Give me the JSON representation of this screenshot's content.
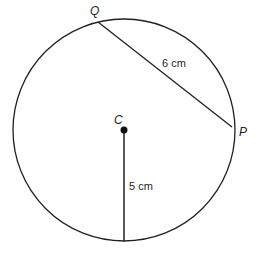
{
  "diagram": {
    "type": "circle-geometry",
    "stroke_color": "#231f20",
    "background": "#ffffff",
    "circle": {
      "center_label": "C",
      "center": [
        124,
        130
      ],
      "radius_px": 111
    },
    "points": [
      {
        "label": "Q",
        "position": [
          98,
          22
        ],
        "label_pos": [
          90,
          15
        ]
      },
      {
        "label": "P",
        "position": [
          232,
          127
        ],
        "label_pos": [
          239,
          136
        ]
      },
      {
        "label": "C",
        "position": [
          124,
          130
        ],
        "label_pos": [
          114,
          124
        ]
      }
    ],
    "segments": [
      {
        "from": "Q",
        "to": "P",
        "type": "chord",
        "length_label": "6 cm",
        "label_pos": [
          162,
          67
        ]
      },
      {
        "from": "C",
        "to": "circle-bottom",
        "type": "radius",
        "length_label": "5 cm",
        "label_pos": [
          129,
          190
        ]
      }
    ]
  }
}
